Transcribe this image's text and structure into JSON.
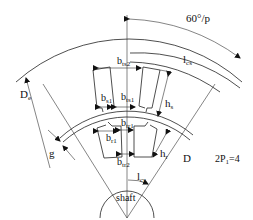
{
  "diagram": {
    "colors": {
      "line": "#222222",
      "background": "#ffffff",
      "text": "#111111"
    },
    "labels": {
      "angle": "60°/p",
      "lcs": "l",
      "lcs_sub": "cs",
      "De": "D",
      "De_sub": "e",
      "bts2": "b",
      "bts2_sub": "ts2",
      "bs1": "b",
      "bs1_sub": "s1",
      "bts1": "b",
      "bts1_sub": "ts1",
      "hs": "h",
      "hs_sub": "s",
      "btr1": "b",
      "btr1_sub": "tr1",
      "br1": "b",
      "br1_sub": "r1",
      "hr": "h",
      "hr_sub": "r",
      "btr2": "b",
      "btr2_sub": "tr2",
      "g": "g",
      "D": "D",
      "lcr": "l",
      "lcr_sub": "cr",
      "shaft": "shaft",
      "poles": "2P",
      "poles_sub": "1",
      "poles_val": "=4"
    }
  }
}
